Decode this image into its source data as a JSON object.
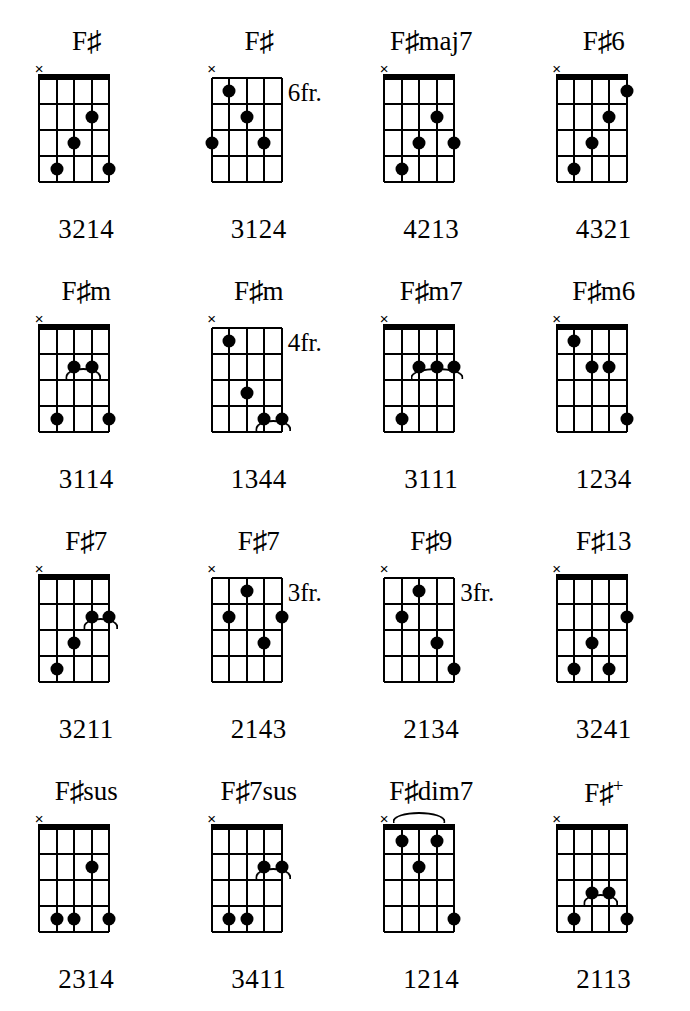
{
  "page": {
    "columns": 4,
    "rows": 4,
    "strings": 5,
    "frets": 4,
    "ink_color": "#000000",
    "background_color": "#ffffff"
  },
  "legend": {
    "mute_symbol": "×",
    "sharp_symbol": "♯",
    "fret_suffix": "fr."
  },
  "chords": [
    {
      "name": "F♯",
      "root": "F",
      "accidental": "♯",
      "suffix": "",
      "fret_label": "",
      "nut": true,
      "muted_string": 0,
      "fingering": "3214",
      "dots": [
        {
          "string": 3,
          "fret": 2
        },
        {
          "string": 2,
          "fret": 3
        },
        {
          "string": 1,
          "fret": 4
        },
        {
          "string": 4,
          "fret": 4
        }
      ],
      "barres": []
    },
    {
      "name": "F♯",
      "root": "F",
      "accidental": "♯",
      "suffix": "",
      "fret_label": "6fr.",
      "nut": false,
      "muted_string": 0,
      "fingering": "3124",
      "dots": [
        {
          "string": 1,
          "fret": 1
        },
        {
          "string": 2,
          "fret": 2
        },
        {
          "string": 0,
          "fret": 3
        },
        {
          "string": 3,
          "fret": 3
        }
      ],
      "barres": []
    },
    {
      "name": "F♯maj7",
      "root": "F",
      "accidental": "♯",
      "suffix": "maj7",
      "fret_label": "",
      "nut": true,
      "muted_string": 0,
      "fingering": "4213",
      "dots": [
        {
          "string": 3,
          "fret": 2
        },
        {
          "string": 2,
          "fret": 3
        },
        {
          "string": 4,
          "fret": 3
        },
        {
          "string": 1,
          "fret": 4
        }
      ],
      "barres": []
    },
    {
      "name": "F♯6",
      "root": "F",
      "accidental": "♯",
      "suffix": "6",
      "fret_label": "",
      "nut": true,
      "muted_string": 0,
      "fingering": "4321",
      "dots": [
        {
          "string": 4,
          "fret": 1
        },
        {
          "string": 3,
          "fret": 2
        },
        {
          "string": 2,
          "fret": 3
        },
        {
          "string": 1,
          "fret": 4
        }
      ],
      "barres": []
    },
    {
      "name": "F♯m",
      "root": "F",
      "accidental": "♯",
      "suffix": "m",
      "fret_label": "",
      "nut": true,
      "muted_string": 0,
      "fingering": "3114",
      "dots": [
        {
          "string": 2,
          "fret": 2
        },
        {
          "string": 3,
          "fret": 2
        },
        {
          "string": 1,
          "fret": 4
        },
        {
          "string": 4,
          "fret": 4
        }
      ],
      "barres": [
        {
          "fret": 2,
          "from_string": 2,
          "to_string": 3
        }
      ]
    },
    {
      "name": "F♯m",
      "root": "F",
      "accidental": "♯",
      "suffix": "m",
      "fret_label": "4fr.",
      "nut": false,
      "muted_string": 0,
      "fingering": "1344",
      "dots": [
        {
          "string": 1,
          "fret": 1
        },
        {
          "string": 2,
          "fret": 3
        },
        {
          "string": 3,
          "fret": 4
        },
        {
          "string": 4,
          "fret": 4
        }
      ],
      "barres": [
        {
          "fret": 4,
          "from_string": 3,
          "to_string": 4
        }
      ]
    },
    {
      "name": "F♯m7",
      "root": "F",
      "accidental": "♯",
      "suffix": "m7",
      "fret_label": "",
      "nut": true,
      "muted_string": 0,
      "fingering": "3111",
      "dots": [
        {
          "string": 2,
          "fret": 2
        },
        {
          "string": 3,
          "fret": 2
        },
        {
          "string": 4,
          "fret": 2
        },
        {
          "string": 1,
          "fret": 4
        }
      ],
      "barres": [
        {
          "fret": 2,
          "from_string": 2,
          "to_string": 4
        }
      ]
    },
    {
      "name": "F♯m6",
      "root": "F",
      "accidental": "♯",
      "suffix": "m6",
      "fret_label": "",
      "nut": true,
      "muted_string": 0,
      "fingering": "1234",
      "dots": [
        {
          "string": 1,
          "fret": 1
        },
        {
          "string": 2,
          "fret": 2
        },
        {
          "string": 3,
          "fret": 2
        },
        {
          "string": 4,
          "fret": 4
        }
      ],
      "barres": []
    },
    {
      "name": "F♯7",
      "root": "F",
      "accidental": "♯",
      "suffix": "7",
      "fret_label": "",
      "nut": true,
      "muted_string": 0,
      "fingering": "3211",
      "dots": [
        {
          "string": 3,
          "fret": 2
        },
        {
          "string": 4,
          "fret": 2
        },
        {
          "string": 2,
          "fret": 3
        },
        {
          "string": 1,
          "fret": 4
        }
      ],
      "barres": [
        {
          "fret": 2,
          "from_string": 3,
          "to_string": 4
        }
      ]
    },
    {
      "name": "F♯7",
      "root": "F",
      "accidental": "♯",
      "suffix": "7",
      "fret_label": "3fr.",
      "nut": false,
      "muted_string": 0,
      "fingering": "2143",
      "dots": [
        {
          "string": 2,
          "fret": 1
        },
        {
          "string": 1,
          "fret": 2
        },
        {
          "string": 4,
          "fret": 2
        },
        {
          "string": 3,
          "fret": 3
        }
      ],
      "barres": []
    },
    {
      "name": "F♯9",
      "root": "F",
      "accidental": "♯",
      "suffix": "9",
      "fret_label": "3fr.",
      "nut": false,
      "muted_string": 0,
      "fingering": "2134",
      "dots": [
        {
          "string": 2,
          "fret": 1
        },
        {
          "string": 1,
          "fret": 2
        },
        {
          "string": 3,
          "fret": 3
        },
        {
          "string": 4,
          "fret": 4
        }
      ],
      "barres": []
    },
    {
      "name": "F♯13",
      "root": "F",
      "accidental": "♯",
      "suffix": "13",
      "fret_label": "",
      "nut": true,
      "muted_string": 0,
      "fingering": "3241",
      "dots": [
        {
          "string": 4,
          "fret": 2
        },
        {
          "string": 2,
          "fret": 3
        },
        {
          "string": 1,
          "fret": 4
        },
        {
          "string": 3,
          "fret": 4
        }
      ],
      "barres": []
    },
    {
      "name": "F♯sus",
      "root": "F",
      "accidental": "♯",
      "suffix": "sus",
      "fret_label": "",
      "nut": true,
      "muted_string": 0,
      "fingering": "2314",
      "dots": [
        {
          "string": 3,
          "fret": 2
        },
        {
          "string": 1,
          "fret": 4
        },
        {
          "string": 2,
          "fret": 4
        },
        {
          "string": 4,
          "fret": 4
        }
      ],
      "barres": []
    },
    {
      "name": "F♯7sus",
      "root": "F",
      "accidental": "♯",
      "suffix": "7sus",
      "fret_label": "",
      "nut": true,
      "muted_string": 0,
      "fingering": "3411",
      "dots": [
        {
          "string": 3,
          "fret": 2
        },
        {
          "string": 4,
          "fret": 2
        },
        {
          "string": 1,
          "fret": 4
        },
        {
          "string": 2,
          "fret": 4
        }
      ],
      "barres": [
        {
          "fret": 2,
          "from_string": 3,
          "to_string": 4
        }
      ]
    },
    {
      "name": "F♯dim7",
      "root": "F",
      "accidental": "♯",
      "suffix": "dim7",
      "fret_label": "",
      "nut": true,
      "muted_string": 0,
      "fingering": "1214",
      "dots": [
        {
          "string": 1,
          "fret": 1
        },
        {
          "string": 3,
          "fret": 1
        },
        {
          "string": 2,
          "fret": 2
        },
        {
          "string": 4,
          "fret": 4
        }
      ],
      "barres": [
        {
          "fret": 0,
          "from_string": 1,
          "to_string": 3
        }
      ]
    },
    {
      "name": "F♯+",
      "root": "F",
      "accidental": "♯",
      "suffix": "+",
      "fret_label": "",
      "nut": true,
      "muted_string": 0,
      "fingering": "2113",
      "dots": [
        {
          "string": 2,
          "fret": 3
        },
        {
          "string": 3,
          "fret": 3
        },
        {
          "string": 1,
          "fret": 4
        },
        {
          "string": 4,
          "fret": 4
        }
      ],
      "barres": [
        {
          "fret": 3,
          "from_string": 2,
          "to_string": 3
        }
      ]
    }
  ]
}
